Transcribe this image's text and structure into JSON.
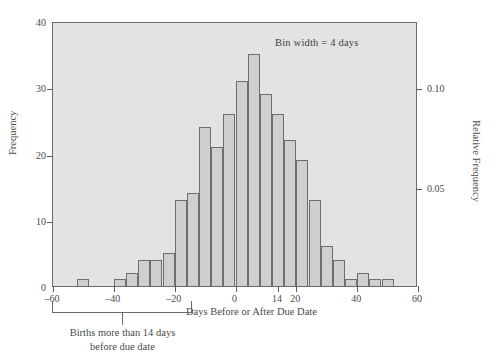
{
  "chart_data": {
    "type": "bar",
    "title": "",
    "subtitle": "",
    "xlabel": "Days Before or After Due Date",
    "ylabel": "Frequency",
    "ylabel_right": "Relative Frequency",
    "annotation": "Bin width = 4 days",
    "bin_width": 4,
    "xlim": [
      -60,
      60
    ],
    "ylim": [
      0,
      40
    ],
    "ylim_right": [
      0,
      0.1333
    ],
    "grid": false,
    "legend": null,
    "x_ticks": [
      -60,
      -40,
      -20,
      0,
      14,
      20,
      40,
      60
    ],
    "x_tick_labels": [
      "–60",
      "–40",
      "–20",
      "0",
      "14",
      "20",
      "40",
      "60"
    ],
    "y_ticks_left": [
      0,
      10,
      20,
      30,
      40
    ],
    "y_tick_labels_left": [
      "0",
      "10",
      "20",
      "30",
      "40"
    ],
    "y_ticks_right": [
      0.05,
      0.1
    ],
    "y_tick_labels_right": [
      "0.05",
      "0.10"
    ],
    "bin_edges": [
      -52,
      -48,
      -44,
      -40,
      -36,
      -32,
      -28,
      -24,
      -20,
      -16,
      -12,
      -8,
      -4,
      0,
      4,
      8,
      12,
      16,
      20,
      24,
      28,
      32,
      36,
      40,
      44,
      48,
      52
    ],
    "bin_starts": [
      -52,
      -48,
      -44,
      -40,
      -36,
      -32,
      -28,
      -24,
      -20,
      -16,
      -12,
      -8,
      -4,
      0,
      4,
      8,
      12,
      16,
      20,
      24,
      28,
      32,
      36,
      40,
      44,
      48
    ],
    "values": [
      1,
      0,
      0,
      1,
      2,
      4,
      4,
      5,
      13,
      14,
      24,
      21,
      26,
      31,
      35,
      29,
      26,
      22,
      19,
      13,
      6,
      4,
      1,
      2,
      1,
      1
    ],
    "bracket": {
      "from": -60,
      "to": -14,
      "caption_line1": "Births more than 14 days",
      "caption_line2": "before due date"
    }
  },
  "colors": {
    "plot_background": "#e3e3e3",
    "bar_fill": "#cfcfcf",
    "bar_stroke": "#6e6e6e",
    "axis": "#6b6b6b",
    "text": "#4a4a4a",
    "page_background": "#ffffff"
  }
}
